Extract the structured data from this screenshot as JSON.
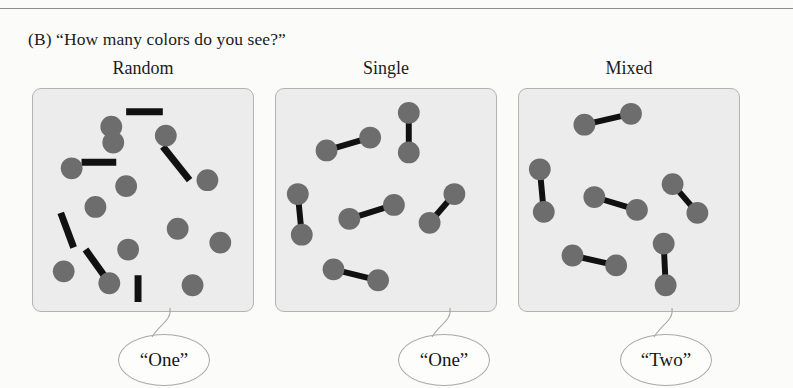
{
  "figure": {
    "caption": "(B)  “How many colors do you see?”",
    "panel_bg": "#ececec",
    "panel_border": "#b3b3b6",
    "dot_color": "#6d6d6d",
    "bar_color": "#111111",
    "bubble_border": "#a9a9ad",
    "bubble_fill": "#fdfdfc"
  },
  "panels": [
    {
      "title": "Random",
      "response": "“One”",
      "dots": [
        {
          "cx": 39,
          "cy": 80
        },
        {
          "cx": 81,
          "cy": 54
        },
        {
          "cx": 134,
          "cy": 47
        },
        {
          "cx": 94,
          "cy": 98
        },
        {
          "cx": 176,
          "cy": 92
        },
        {
          "cx": 63,
          "cy": 119
        },
        {
          "cx": 146,
          "cy": 141
        },
        {
          "cx": 189,
          "cy": 155
        },
        {
          "cx": 96,
          "cy": 162
        },
        {
          "cx": 31,
          "cy": 184
        },
        {
          "cx": 77,
          "cy": 196
        },
        {
          "cx": 161,
          "cy": 198
        },
        {
          "cx": 79,
          "cy": 38
        }
      ],
      "bars": [
        {
          "x1": 94,
          "y1": 23,
          "x2": 131,
          "y2": 23
        },
        {
          "x1": 49,
          "y1": 74,
          "x2": 84,
          "y2": 74
        },
        {
          "x1": 131,
          "y1": 58,
          "x2": 158,
          "y2": 92
        },
        {
          "x1": 28,
          "y1": 125,
          "x2": 41,
          "y2": 160
        },
        {
          "x1": 53,
          "y1": 162,
          "x2": 73,
          "y2": 190
        },
        {
          "x1": 106,
          "y1": 188,
          "x2": 106,
          "y2": 215
        }
      ]
    },
    {
      "title": "Single",
      "response": "“One”",
      "pairs": [
        {
          "x1": 51,
          "y1": 62,
          "x2": 95,
          "y2": 49
        },
        {
          "x1": 134,
          "y1": 24,
          "x2": 134,
          "y2": 64
        },
        {
          "x1": 22,
          "y1": 106,
          "x2": 26,
          "y2": 147
        },
        {
          "x1": 74,
          "y1": 131,
          "x2": 119,
          "y2": 117
        },
        {
          "x1": 155,
          "y1": 135,
          "x2": 180,
          "y2": 106
        },
        {
          "x1": 58,
          "y1": 182,
          "x2": 103,
          "y2": 193
        }
      ]
    },
    {
      "title": "Mixed",
      "response": "“Two”",
      "pairs": [
        {
          "x1": 66,
          "y1": 36,
          "x2": 113,
          "y2": 25
        },
        {
          "x1": 21,
          "y1": 81,
          "x2": 25,
          "y2": 124
        },
        {
          "x1": 76,
          "y1": 109,
          "x2": 119,
          "y2": 122
        },
        {
          "x1": 155,
          "y1": 96,
          "x2": 180,
          "y2": 125
        },
        {
          "x1": 54,
          "y1": 168,
          "x2": 98,
          "y2": 178
        },
        {
          "x1": 146,
          "y1": 156,
          "x2": 148,
          "y2": 198
        }
      ]
    }
  ]
}
